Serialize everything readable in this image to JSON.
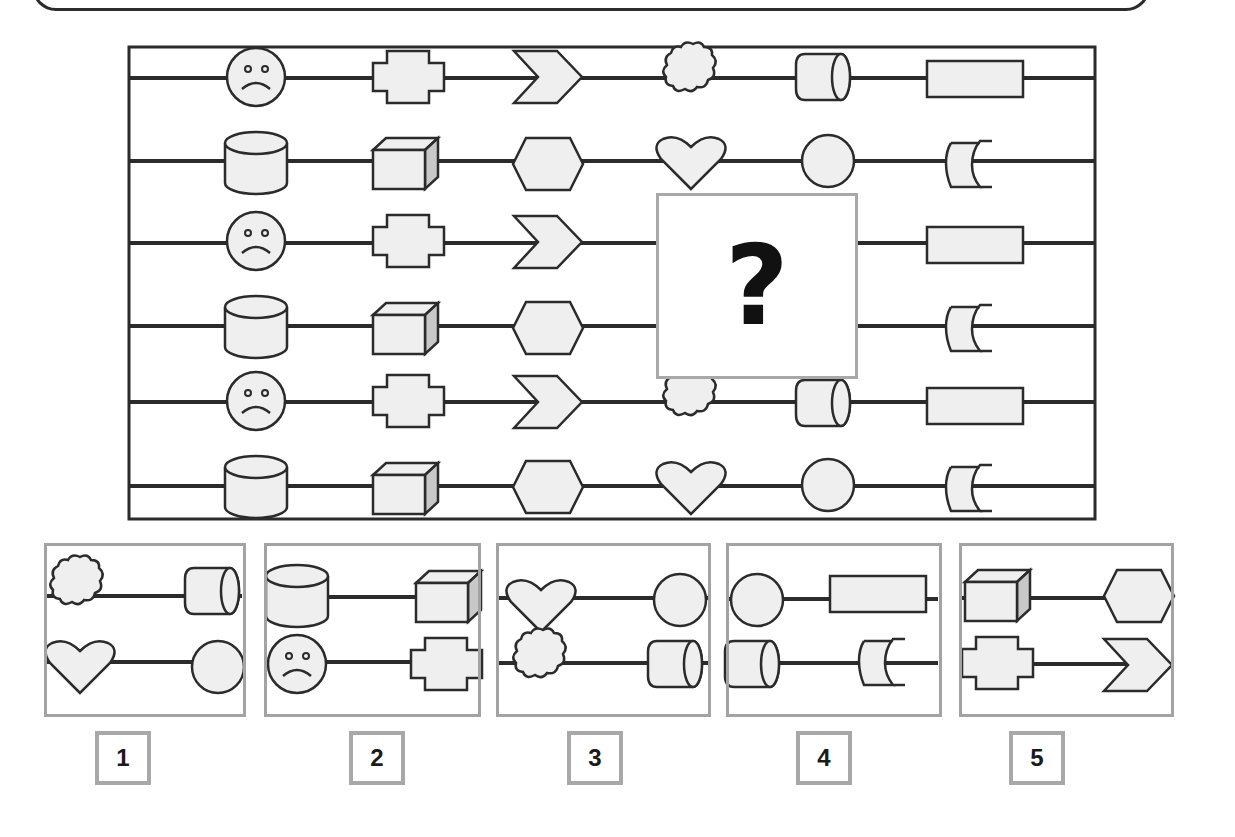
{
  "puzzle": {
    "title": "",
    "grid": {
      "rows": [
        [
          "sad-face",
          "stepped-cross",
          "chevron",
          "cloud",
          "horizontal-cylinder",
          "rectangle"
        ],
        [
          "cylinder",
          "cube",
          "hexagon",
          "heart",
          "circle",
          "concave-shield"
        ],
        [
          "sad-face",
          "stepped-cross",
          "chevron",
          "?",
          "?",
          "rectangle"
        ],
        [
          "cylinder",
          "cube",
          "hexagon",
          "?",
          "?",
          "concave-shield"
        ],
        [
          "sad-face",
          "stepped-cross",
          "chevron",
          "cloud",
          "horizontal-cylinder",
          "rectangle"
        ],
        [
          "cylinder",
          "cube",
          "hexagon",
          "heart",
          "circle",
          "concave-shield"
        ]
      ],
      "missing_label": "?"
    },
    "options": [
      {
        "label": "1",
        "top": [
          "cloud",
          "horizontal-cylinder"
        ],
        "bottom": [
          "heart",
          "circle"
        ]
      },
      {
        "label": "2",
        "top": [
          "cylinder",
          "cube"
        ],
        "bottom": [
          "sad-face",
          "stepped-cross"
        ]
      },
      {
        "label": "3",
        "top": [
          "heart",
          "circle"
        ],
        "bottom": [
          "cloud",
          "horizontal-cylinder"
        ]
      },
      {
        "label": "4",
        "top": [
          "circle",
          "rectangle"
        ],
        "bottom": [
          "horizontal-cylinder",
          "concave-shield"
        ]
      },
      {
        "label": "5",
        "top": [
          "cube",
          "hexagon"
        ],
        "bottom": [
          "stepped-cross",
          "chevron"
        ]
      }
    ],
    "colors": {
      "stroke": "#2b2b2b",
      "fill": "#efefef",
      "frame_gray": "#a8a8a8",
      "cube_side": "#c8c8c8"
    }
  }
}
